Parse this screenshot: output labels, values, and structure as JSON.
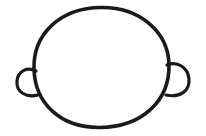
{
  "drawing": {
    "subject": "head outline with ears",
    "stroke_color": "#1a1a1a",
    "background_color": "#ffffff",
    "stroke_width": 3.5
  }
}
